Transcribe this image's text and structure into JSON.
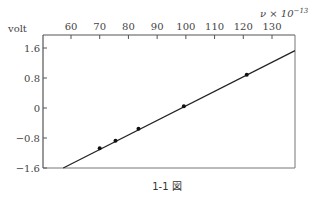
{
  "chart_data": {
    "type": "scatter",
    "title": "",
    "caption": "1-1 図",
    "xlabel": "ν × 10⁻¹³",
    "ylabel": "volt",
    "xlim": [
      50,
      138
    ],
    "ylim": [
      -1.6,
      2.0
    ],
    "x_ticks": [
      60,
      70,
      80,
      90,
      100,
      110,
      120,
      130
    ],
    "y_ticks": [
      1.6,
      0.8,
      0,
      -0.8,
      -1.6
    ],
    "y_tick_labels": [
      "1.6",
      "0.8",
      "0",
      "−0.8",
      "−1.6"
    ],
    "x_axis_position": "top",
    "grid": false,
    "series": [
      {
        "name": "measured",
        "marker": "dot",
        "x": [
          70.0,
          75.5,
          83.5,
          99.3,
          121.2
        ],
        "y": [
          -1.07,
          -0.87,
          -0.55,
          0.05,
          0.89
        ]
      }
    ],
    "fit_line": {
      "x": [
        57.3,
        138
      ],
      "y": [
        -1.6,
        1.53
      ]
    }
  },
  "labels": {
    "y_axis_title": "volt",
    "x_axis_title_nu": "ν × 10",
    "x_axis_title_exp": "−13",
    "caption": "1-1 図"
  }
}
